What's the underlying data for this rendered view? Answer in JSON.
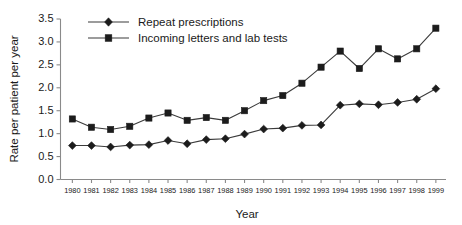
{
  "chart_data": {
    "type": "line",
    "title": "",
    "xlabel": "Year",
    "ylabel": "Rate per patient per year",
    "categories": [
      "1980",
      "1981",
      "1982",
      "1983",
      "1984",
      "1985",
      "1986",
      "1987",
      "1988",
      "1989",
      "1990",
      "1991",
      "1992",
      "1993",
      "1994",
      "1995",
      "1996",
      "1997",
      "1998",
      "1999"
    ],
    "x": [
      1980,
      1981,
      1982,
      1983,
      1984,
      1985,
      1986,
      1987,
      1988,
      1989,
      1990,
      1991,
      1992,
      1993,
      1994,
      1995,
      1996,
      1997,
      1998,
      1999
    ],
    "series": [
      {
        "name": "Repeat prescriptions",
        "marker": "diamond",
        "color": "#1c1c1c",
        "values": [
          0.74,
          0.74,
          0.71,
          0.75,
          0.76,
          0.85,
          0.78,
          0.87,
          0.89,
          0.99,
          1.1,
          1.12,
          1.18,
          1.19,
          1.62,
          1.65,
          1.63,
          1.68,
          1.75,
          1.98
        ]
      },
      {
        "name": "Incoming letters and lab tests",
        "marker": "square",
        "color": "#1c1c1c",
        "values": [
          1.32,
          1.14,
          1.09,
          1.16,
          1.34,
          1.45,
          1.29,
          1.35,
          1.29,
          1.5,
          1.72,
          1.83,
          2.1,
          2.45,
          2.8,
          2.42,
          2.85,
          2.63,
          2.85,
          3.3
        ]
      }
    ],
    "ylim": [
      0.0,
      3.5
    ],
    "yticks": [
      0.0,
      0.5,
      1.0,
      1.5,
      2.0,
      2.5,
      3.0,
      3.5
    ],
    "ytick_labels": [
      "0.0",
      "0.5",
      "1.0",
      "1.5",
      "2.0",
      "2.5",
      "3.0",
      "3.5"
    ],
    "grid": false,
    "legend_position": "top-left-inside",
    "legend_entries": [
      "Repeat prescriptions",
      "Incoming letters and lab tests"
    ],
    "axis_color": "#8a8a8a",
    "line_color": "#3b3b3b"
  }
}
